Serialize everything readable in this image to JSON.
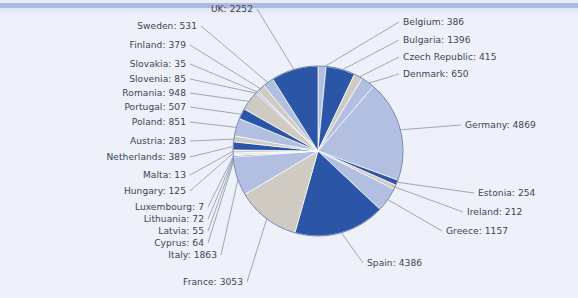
{
  "chart_data": {
    "type": "pie",
    "title": "",
    "subtitle": "",
    "xlabel": "",
    "ylabel": "",
    "legend_position": "none",
    "grid": false,
    "label_format": "{name}: {value}",
    "start_angle_deg": 0,
    "direction": "clockwise",
    "total": 24021,
    "categories": [
      "Belgium",
      "Bulgaria",
      "Czech Republic",
      "Denmark",
      "Germany",
      "Estonia",
      "Ireland",
      "Greece",
      "Spain",
      "France",
      "Italy",
      "Cyprus",
      "Latvia",
      "Lithuania",
      "Luxembourg",
      "Hungary",
      "Malta",
      "Netherlands",
      "Austria",
      "Poland",
      "Portugal",
      "Romania",
      "Slovenia",
      "Slovakia",
      "Finland",
      "Sweden",
      "UK"
    ],
    "values": [
      386,
      1396,
      415,
      650,
      4869,
      254,
      212,
      1157,
      4386,
      3053,
      1863,
      64,
      55,
      72,
      7,
      125,
      13,
      389,
      283,
      851,
      507,
      948,
      85,
      35,
      379,
      531,
      2252
    ],
    "slice_colors": [
      "#b3bfe0",
      "#2b55a6",
      "#cfcbc2",
      "#b3bfe0",
      "#b3bfe0",
      "#2b55a6",
      "#cfcbc2",
      "#b3bfe0",
      "#2b55a6",
      "#cfcbc2",
      "#b3bfe0",
      "#2b55a6",
      "#cfcbc2",
      "#b3bfe0",
      "#2b55a6",
      "#cfcbc2",
      "#b3bfe0",
      "#2b55a6",
      "#cfcbc2",
      "#b3bfe0",
      "#2b55a6",
      "#cfcbc2",
      "#b3bfe0",
      "#2b55a6",
      "#cfcbc2",
      "#b3bfe0",
      "#2b55a6"
    ],
    "labels": [
      {
        "name": "UK",
        "value": 2252,
        "text": "UK: 2252",
        "side": "left",
        "x": 253,
        "y": 9
      },
      {
        "name": "Sweden",
        "value": 531,
        "text": "Sweden: 531",
        "side": "left",
        "x": 197,
        "y": 26
      },
      {
        "name": "Finland",
        "value": 379,
        "text": "Finland: 379",
        "side": "left",
        "x": 186,
        "y": 45
      },
      {
        "name": "Slovakia",
        "value": 35,
        "text": "Slovakia: 35",
        "side": "left",
        "x": 186,
        "y": 64
      },
      {
        "name": "Slovenia",
        "value": 85,
        "text": "Slovenia: 85",
        "side": "left",
        "x": 186,
        "y": 79
      },
      {
        "name": "Romania",
        "value": 948,
        "text": "Romania: 948",
        "side": "left",
        "x": 186,
        "y": 93
      },
      {
        "name": "Portugal",
        "value": 507,
        "text": "Portugal: 507",
        "side": "left",
        "x": 186,
        "y": 107
      },
      {
        "name": "Poland",
        "value": 851,
        "text": "Poland: 851",
        "side": "left",
        "x": 186,
        "y": 122
      },
      {
        "name": "Austria",
        "value": 283,
        "text": "Austria: 283",
        "side": "left",
        "x": 186,
        "y": 141
      },
      {
        "name": "Netherlands",
        "value": 389,
        "text": "Netherlands: 389",
        "side": "left",
        "x": 186,
        "y": 157
      },
      {
        "name": "Malta",
        "value": 13,
        "text": "Malta: 13",
        "side": "left",
        "x": 186,
        "y": 175
      },
      {
        "name": "Hungary",
        "value": 125,
        "text": "Hungary: 125",
        "side": "left",
        "x": 186,
        "y": 191
      },
      {
        "name": "Luxembourg",
        "value": 7,
        "text": "Luxembourg: 7",
        "side": "left",
        "x": 204,
        "y": 207
      },
      {
        "name": "Lithuania",
        "value": 72,
        "text": "Lithuania: 72",
        "side": "left",
        "x": 204,
        "y": 219
      },
      {
        "name": "Latvia",
        "value": 55,
        "text": "Latvia: 55",
        "side": "left",
        "x": 204,
        "y": 231
      },
      {
        "name": "Cyprus",
        "value": 64,
        "text": "Cyprus: 64",
        "side": "left",
        "x": 204,
        "y": 243
      },
      {
        "name": "Italy",
        "value": 1863,
        "text": "Italy: 1863",
        "side": "left",
        "x": 217,
        "y": 255
      },
      {
        "name": "France",
        "value": 3053,
        "text": "France: 3053",
        "side": "left",
        "x": 243,
        "y": 282
      },
      {
        "name": "Belgium",
        "value": 386,
        "text": "Belgium: 386",
        "side": "right",
        "x": 403,
        "y": 22
      },
      {
        "name": "Bulgaria",
        "value": 1396,
        "text": "Bulgaria: 1396",
        "side": "right",
        "x": 403,
        "y": 40
      },
      {
        "name": "Czech Republic",
        "value": 415,
        "text": "Czech Republic: 415",
        "side": "right",
        "x": 403,
        "y": 57
      },
      {
        "name": "Denmark",
        "value": 650,
        "text": "Denmark: 650",
        "side": "right",
        "x": 403,
        "y": 74
      },
      {
        "name": "Germany",
        "value": 4869,
        "text": "Germany: 4869",
        "side": "right",
        "x": 465,
        "y": 125
      },
      {
        "name": "Estonia",
        "value": 254,
        "text": "Estonia: 254",
        "side": "right",
        "x": 478,
        "y": 193
      },
      {
        "name": "Ireland",
        "value": 212,
        "text": "Ireland: 212",
        "side": "right",
        "x": 467,
        "y": 212
      },
      {
        "name": "Greece",
        "value": 1157,
        "text": "Greece: 1157",
        "side": "right",
        "x": 446,
        "y": 231
      },
      {
        "name": "Spain",
        "value": 4386,
        "text": "Spain: 4386",
        "side": "right",
        "x": 367,
        "y": 263
      }
    ]
  },
  "style": {
    "background": "#eef1fa",
    "top_band": "#aeb9de",
    "text_color": "#3c4454",
    "leader_line": "#6b7489",
    "pie_outline": "#6b7fae",
    "color_light": "#b3bfe0",
    "color_dark": "#2b55a6",
    "color_gray": "#cfcbc2"
  }
}
